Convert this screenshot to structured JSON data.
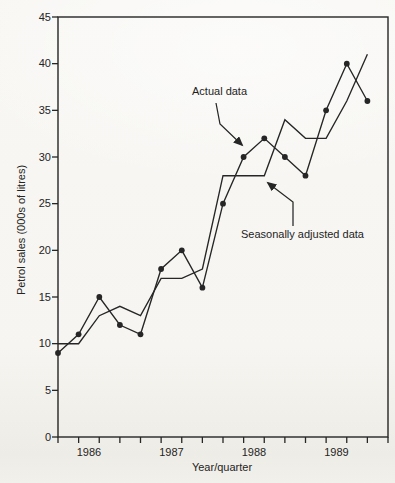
{
  "page": {
    "background_color": "#f6f5f2",
    "ink_color": "#262626"
  },
  "chart_data": {
    "type": "line",
    "title": "",
    "xlabel": "Year/quarter",
    "ylabel": "Petrol sales (000s of litres)",
    "ylim": [
      0,
      45
    ],
    "ytick_step": 5,
    "yticks": [
      0,
      5,
      10,
      15,
      20,
      25,
      30,
      35,
      40,
      45
    ],
    "grid": false,
    "plot_border": "full box",
    "legend_position": "none-inline-annotations",
    "x_unit": "quarter",
    "n_points": 16,
    "year_labels": [
      "1986",
      "1987",
      "1988",
      "1989"
    ],
    "quarters_per_year": 4,
    "series": [
      {
        "name": "Actual data",
        "marker": "filled-circle",
        "line_style": "solid",
        "color": "#262626",
        "values": [
          9,
          11,
          15,
          12,
          11,
          18,
          20,
          16,
          25,
          30,
          32,
          30,
          28,
          35,
          40,
          36
        ]
      },
      {
        "name": "Seasonally adjusted data",
        "marker": "none",
        "line_style": "solid",
        "color": "#262626",
        "values": [
          10,
          10,
          13,
          14,
          13,
          17,
          17,
          18,
          28,
          28,
          28,
          34,
          32,
          32,
          36,
          41
        ]
      }
    ],
    "annotations": [
      {
        "text": "Actual data",
        "text_px": {
          "x": 192,
          "y": 85
        },
        "arrow_px": [
          [
            216,
            103
          ],
          [
            220,
            124
          ],
          [
            242,
            145
          ]
        ]
      },
      {
        "text": "Seasonally adjusted data",
        "text_px": {
          "x": 241,
          "y": 228
        },
        "arrow_px": [
          [
            293,
            226
          ],
          [
            293,
            202
          ],
          [
            268,
            183
          ]
        ]
      }
    ]
  }
}
